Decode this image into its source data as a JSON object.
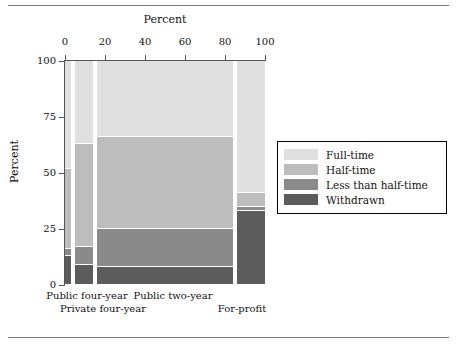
{
  "figure": {
    "rules": [
      "top-rule",
      "bottom-rule"
    ]
  },
  "axes": {
    "x_title": "Percent",
    "y_title": "Percent",
    "x_ticks": [
      "0",
      "20",
      "40",
      "60",
      "80",
      "100"
    ],
    "x_tick_values": [
      0,
      20,
      40,
      60,
      80,
      100
    ],
    "y_ticks": [
      "100",
      "75",
      "50",
      "25",
      "0"
    ],
    "y_tick_values": [
      100,
      75,
      50,
      25,
      0
    ]
  },
  "legend": {
    "items": [
      {
        "label": "Full-time",
        "color": "#e0e0e0"
      },
      {
        "label": "Half-time",
        "color": "#bdbdbd"
      },
      {
        "label": "Less than half-time",
        "color": "#8a8a8a"
      },
      {
        "label": "Withdrawn",
        "color": "#5c5c5c"
      }
    ]
  },
  "category_labels": [
    {
      "text": "Public four-year",
      "row": 0
    },
    {
      "text": "Public two-year",
      "row": 0
    },
    {
      "text": "Private four-year",
      "row": 1
    },
    {
      "text": "For-profit",
      "row": 1
    }
  ],
  "chart_data": {
    "type": "bar",
    "subtype": "mosaic-spine-plot",
    "title": "",
    "xlabel": "Percent",
    "ylabel": "Percent",
    "xlim": [
      0,
      100
    ],
    "ylim": [
      0,
      100
    ],
    "grid": false,
    "legend_position": "right",
    "stacking": "percent",
    "note": "Column widths encode each sector's share of total enrollment (x axis, Percent); segment heights encode enrollment-intensity composition within the sector (y axis, Percent).",
    "categories": [
      "Public four-year",
      "Private four-year",
      "Public two-year",
      "For-profit"
    ],
    "column_extents": [
      {
        "category": "Public four-year",
        "x_start": 0,
        "x_end": 4,
        "width": 4
      },
      {
        "category": "Private four-year",
        "x_start": 5,
        "x_end": 15,
        "width": 10
      },
      {
        "category": "Public two-year",
        "x_start": 16,
        "x_end": 85,
        "width": 69
      },
      {
        "category": "For-profit",
        "x_start": 86,
        "x_end": 100,
        "width": 14
      }
    ],
    "series": [
      {
        "name": "Full-time",
        "color": "#e0e0e0",
        "values": [
          48,
          37,
          34,
          59
        ]
      },
      {
        "name": "Half-time",
        "color": "#bdbdbd",
        "values": [
          36,
          46,
          41,
          6
        ]
      },
      {
        "name": "Less than half-time",
        "color": "#8a8a8a",
        "values": [
          3,
          8,
          17,
          2
        ]
      },
      {
        "name": "Withdrawn",
        "color": "#5c5c5c",
        "values": [
          13,
          9,
          8,
          33
        ]
      }
    ],
    "cumulative_boundaries": {
      "Public four-year": {
        "full_time_bottom": 52,
        "half_time_bottom": 16,
        "less_than_half_bottom": 13
      },
      "Private four-year": {
        "full_time_bottom": 63,
        "half_time_bottom": 17,
        "less_than_half_bottom": 9
      },
      "Public two-year": {
        "full_time_bottom": 66,
        "half_time_bottom": 25,
        "less_than_half_bottom": 8
      },
      "For-profit": {
        "full_time_bottom": 41,
        "half_time_bottom": 35,
        "less_than_half_bottom": 33
      }
    }
  },
  "colors": {
    "full_time": "#e0e0e0",
    "half_time": "#bdbdbd",
    "less_than_half_time": "#8a8a8a",
    "withdrawn": "#5c5c5c",
    "axis": "#555555",
    "rule": "#777777"
  }
}
